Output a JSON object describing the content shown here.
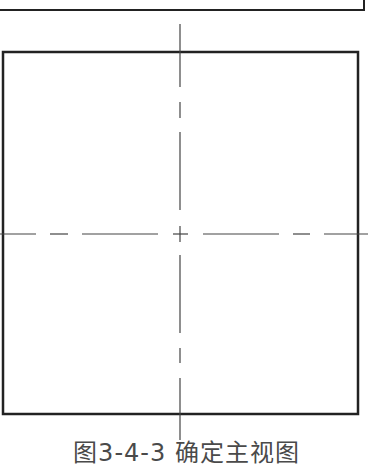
{
  "figure": {
    "caption": "图3-4-3  确定主视图",
    "line_color": "#222222",
    "centerline_color": "#444444"
  },
  "shapes": {
    "top_box": {
      "x": -5,
      "y": -20,
      "right": 364,
      "bottom": 10
    },
    "square": {
      "x": 3,
      "y": 52,
      "right": 358,
      "bottom": 414
    },
    "center": {
      "x": 180,
      "y": 234
    }
  }
}
